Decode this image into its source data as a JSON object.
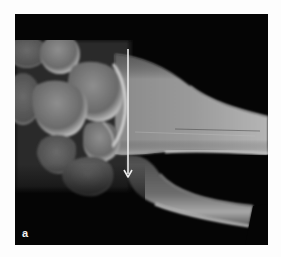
{
  "figure": {
    "panel_label": "a",
    "image_subject": "wrist-radiograph",
    "annotation": {
      "type": "arrow",
      "direction": "down",
      "color": "#e8e8e8"
    },
    "colors": {
      "background": "#050505",
      "page": "#fdfdfd",
      "bone_light": "#bdbdbd",
      "bone_mid": "#7a7a7a",
      "bone_dark": "#3a3a3a"
    }
  }
}
